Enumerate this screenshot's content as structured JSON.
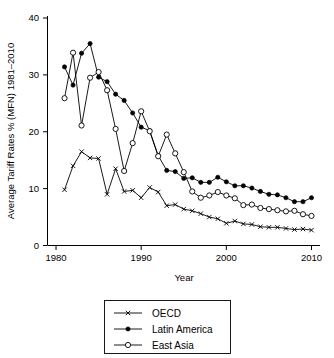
{
  "chart_data": {
    "type": "line",
    "title": "",
    "xlabel": "Year",
    "ylabel": "Average Tariff Rates % (MFN) 1981–2010",
    "xlim": [
      1979,
      2011
    ],
    "ylim": [
      0,
      40
    ],
    "xticks": [
      1980,
      1990,
      2000,
      2010
    ],
    "xtick_labels": [
      "1980",
      "1990",
      "2000",
      "2010"
    ],
    "yticks": [
      0,
      10,
      20,
      30,
      40
    ],
    "ytick_labels": [
      "0",
      "10",
      "20",
      "30",
      "40"
    ],
    "grid": false,
    "legend_position": "below-center",
    "x": [
      1981,
      1982,
      1983,
      1984,
      1985,
      1986,
      1987,
      1988,
      1989,
      1990,
      1991,
      1992,
      1993,
      1994,
      1995,
      1996,
      1997,
      1998,
      1999,
      2000,
      2001,
      2002,
      2003,
      2004,
      2005,
      2006,
      2007,
      2008,
      2009,
      2010
    ],
    "series": [
      {
        "name": "OECD",
        "marker": "x",
        "marker_style": "cross",
        "values": [
          9.8,
          14.0,
          16.5,
          15.4,
          15.3,
          9.0,
          13.5,
          9.5,
          9.7,
          8.4,
          10.2,
          9.4,
          7.0,
          7.2,
          6.4,
          6.1,
          5.6,
          5.0,
          4.7,
          3.9,
          4.3,
          3.8,
          3.7,
          3.3,
          3.2,
          3.2,
          3.0,
          2.8,
          2.9,
          2.7
        ]
      },
      {
        "name": "Latin America",
        "marker": "filled-circle",
        "marker_style": "solid",
        "values": [
          31.4,
          28.2,
          33.8,
          35.5,
          29.6,
          28.8,
          26.6,
          25.5,
          23.3,
          20.8,
          20.2,
          15.8,
          13.2,
          13.0,
          11.8,
          11.9,
          11.1,
          11.1,
          12.0,
          11.2,
          10.5,
          10.5,
          10.1,
          9.5,
          9.0,
          8.9,
          8.4,
          7.7,
          7.7,
          8.4
        ]
      },
      {
        "name": "East Asia",
        "marker": "open-circle",
        "marker_style": "hollow",
        "values": [
          25.9,
          33.9,
          21.1,
          29.5,
          30.5,
          27.3,
          20.5,
          13.1,
          18.0,
          23.6,
          20.1,
          15.7,
          19.5,
          16.2,
          12.9,
          9.5,
          8.4,
          8.8,
          9.4,
          8.8,
          8.3,
          7.1,
          7.2,
          6.6,
          6.4,
          6.2,
          6.0,
          6.1,
          5.5,
          5.2
        ]
      }
    ],
    "legend": [
      {
        "label": "OECD",
        "marker": "cross"
      },
      {
        "label": "Latin America",
        "marker": "solid"
      },
      {
        "label": "East Asia",
        "marker": "hollow"
      }
    ],
    "colors": {
      "axis": "#000000",
      "series": "#000000",
      "background": "#ffffff"
    }
  }
}
